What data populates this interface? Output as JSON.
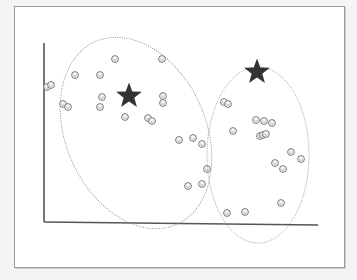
{
  "caption": "",
  "colors": {
    "background": "#f4f4f4",
    "frame": "#ffffff",
    "frame_border": "#9a9a9a",
    "axis": "#555555",
    "ellipse": "#8a8a8a",
    "point": "#666666",
    "centroid": "#333333"
  },
  "axes": {
    "origin": [
      44,
      222
    ],
    "y_top": 43,
    "x_end": 318
  },
  "clusters": [
    {
      "name": "cluster-1",
      "ellipse": {
        "cx": 136,
        "cy": 133,
        "rx": 70,
        "ry": 100,
        "rotate": -24
      },
      "centroid": {
        "x": 129,
        "y": 96,
        "icon": "star"
      },
      "points": [
        [
          47,
          87
        ],
        [
          51,
          85
        ],
        [
          63,
          104
        ],
        [
          68,
          107
        ],
        [
          75,
          75
        ],
        [
          100,
          75
        ],
        [
          115,
          59
        ],
        [
          102,
          97
        ],
        [
          100,
          107
        ],
        [
          125,
          117
        ],
        [
          148,
          118
        ],
        [
          152,
          121
        ],
        [
          162,
          59
        ],
        [
          163,
          96
        ],
        [
          163,
          103
        ],
        [
          179,
          140
        ],
        [
          193,
          138
        ],
        [
          202,
          144
        ],
        [
          207,
          169
        ],
        [
          188,
          186
        ],
        [
          202,
          184
        ]
      ]
    },
    {
      "name": "cluster-2",
      "ellipse": {
        "cx": 258,
        "cy": 155,
        "rx": 51,
        "ry": 88,
        "rotate": 0
      },
      "centroid": {
        "x": 257,
        "y": 72,
        "icon": "star"
      },
      "points": [
        [
          224,
          102
        ],
        [
          228,
          104
        ],
        [
          233,
          131
        ],
        [
          256,
          120
        ],
        [
          260,
          136
        ],
        [
          263,
          135
        ],
        [
          266,
          134
        ],
        [
          264,
          121
        ],
        [
          272,
          123
        ],
        [
          291,
          152
        ],
        [
          301,
          159
        ],
        [
          275,
          163
        ],
        [
          283,
          169
        ],
        [
          281,
          203
        ],
        [
          227,
          213
        ],
        [
          245,
          212
        ]
      ]
    }
  ],
  "point_icon": "smiley-face-icon",
  "centroid_icon": "star-icon"
}
